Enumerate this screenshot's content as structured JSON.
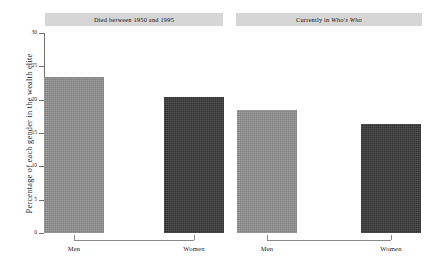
{
  "chart_data": {
    "type": "bar",
    "title": "",
    "xlabel": "",
    "ylabel": "Percentage of each gender in the wealth elite",
    "ylim": [
      0,
      30
    ],
    "yticks": [
      0,
      5,
      10,
      15,
      20,
      25,
      30
    ],
    "ytick_labels": [
      "0",
      "5",
      "10",
      "15",
      "20",
      "25",
      "30"
    ],
    "grid": false,
    "legend": "none",
    "categories": [
      "Men",
      "Women"
    ],
    "panels": [
      {
        "title_parts": [
          {
            "text": "Died between 1950 and 1995",
            "italic": false
          }
        ],
        "title_plain": "Died between 1950 and 1995",
        "bars": [
          {
            "category": "Men",
            "value": 23.4,
            "color": "#919191",
            "style": "light"
          },
          {
            "category": "Women",
            "value": 20.4,
            "color": "#3b3b3b",
            "style": "dark"
          }
        ]
      },
      {
        "title_parts": [
          {
            "text": "Currently in ",
            "italic": false
          },
          {
            "text": "Who's Who",
            "italic": true
          }
        ],
        "title_plain": "Currently in Who's Who",
        "bars": [
          {
            "category": "Men",
            "value": 18.5,
            "color": "#919191",
            "style": "light"
          },
          {
            "category": "Women",
            "value": 16.3,
            "color": "#3b3b3b",
            "style": "dark"
          }
        ]
      }
    ],
    "colors": {
      "men_bar": "#919191",
      "women_bar": "#3b3b3b",
      "strip_background": "#d6d6d6",
      "axis": "#6f6f6f",
      "background": "#ffffff"
    }
  }
}
